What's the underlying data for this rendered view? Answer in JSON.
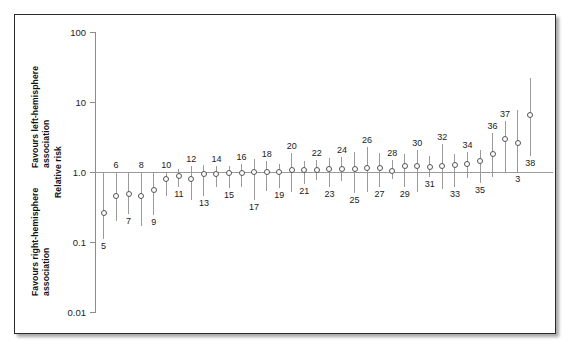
{
  "figure": {
    "kind": "forest-plot",
    "border_color": "#2b2b2b",
    "background": "#ffffff"
  },
  "axis": {
    "y_title": "Relative risk",
    "upper_region_label_line1": "Favours left-hemisphere",
    "upper_region_label_line2": "association",
    "lower_region_label_line1": "Favours right-hemisphere",
    "lower_region_label_line2": "association",
    "tick_labels": [
      "100",
      "10",
      "1.0",
      "0.1",
      "0.01"
    ],
    "tick_values": [
      100,
      10,
      1.0,
      0.1,
      0.01
    ],
    "reference_value": "1.0",
    "scale": "log10",
    "line_color": "#8c8c8c"
  },
  "chart_data": {
    "type": "scatter",
    "title": "",
    "subtitle": "",
    "xlabel": "",
    "ylabel": "Relative risk",
    "ylim": [
      0.01,
      100
    ],
    "yscale": "log",
    "grid": false,
    "legend": null,
    "annotations": [
      "Favours left-hemisphere association",
      "Favours right-hemisphere association"
    ],
    "reference_line": 1.0,
    "marker": "open-circle",
    "error_bar": "95% confidence interval",
    "categories": [
      "5",
      "6",
      "7",
      "8",
      "9",
      "10",
      "11",
      "12",
      "13",
      "14",
      "15",
      "16",
      "17",
      "18",
      "19",
      "20",
      "21",
      "22",
      "23",
      "24",
      "25",
      "26",
      "27",
      "28",
      "29",
      "30",
      "31",
      "32",
      "33",
      "34",
      "35",
      "36",
      "37",
      "3",
      "38"
    ],
    "points": [
      {
        "label": "5",
        "label_side": "below",
        "value": 0.26,
        "low": 0.11,
        "high": 1.0
      },
      {
        "label": "6",
        "label_side": "above",
        "value": 0.45,
        "low": 0.2,
        "high": 1.0
      },
      {
        "label": "7",
        "label_side": "below",
        "value": 0.48,
        "low": 0.25,
        "high": 1.0
      },
      {
        "label": "8",
        "label_side": "above",
        "value": 0.46,
        "low": 0.17,
        "high": 1.0
      },
      {
        "label": "9",
        "label_side": "below",
        "value": 0.55,
        "low": 0.24,
        "high": 1.0
      },
      {
        "label": "10",
        "label_side": "above",
        "value": 0.8,
        "low": 0.45,
        "high": 1.0
      },
      {
        "label": "11",
        "label_side": "below",
        "value": 0.88,
        "low": 0.62,
        "high": 1.12
      },
      {
        "label": "12",
        "label_side": "above",
        "value": 0.8,
        "low": 0.4,
        "high": 1.2
      },
      {
        "label": "13",
        "label_side": "below",
        "value": 0.93,
        "low": 0.46,
        "high": 1.25
      },
      {
        "label": "14",
        "label_side": "above",
        "value": 0.93,
        "low": 0.62,
        "high": 1.22
      },
      {
        "label": "15",
        "label_side": "below",
        "value": 0.96,
        "low": 0.6,
        "high": 1.22
      },
      {
        "label": "16",
        "label_side": "above",
        "value": 0.97,
        "low": 0.62,
        "high": 1.3
      },
      {
        "label": "17",
        "label_side": "below",
        "value": 1.0,
        "low": 0.4,
        "high": 1.55
      },
      {
        "label": "18",
        "label_side": "above",
        "value": 1.0,
        "low": 0.54,
        "high": 1.45
      },
      {
        "label": "19",
        "label_side": "below",
        "value": 1.0,
        "low": 0.6,
        "high": 1.3
      },
      {
        "label": "20",
        "label_side": "above",
        "value": 1.06,
        "low": 0.52,
        "high": 1.85
      },
      {
        "label": "21",
        "label_side": "below",
        "value": 1.06,
        "low": 0.68,
        "high": 1.42
      },
      {
        "label": "22",
        "label_side": "above",
        "value": 1.08,
        "low": 0.78,
        "high": 1.5
      },
      {
        "label": "23",
        "label_side": "below",
        "value": 1.1,
        "low": 0.62,
        "high": 1.6
      },
      {
        "label": "24",
        "label_side": "above",
        "value": 1.12,
        "low": 0.74,
        "high": 1.62
      },
      {
        "label": "25",
        "label_side": "below",
        "value": 1.12,
        "low": 0.5,
        "high": 1.95
      },
      {
        "label": "26",
        "label_side": "above",
        "value": 1.13,
        "low": 0.52,
        "high": 2.3
      },
      {
        "label": "27",
        "label_side": "below",
        "value": 1.15,
        "low": 0.62,
        "high": 1.85
      },
      {
        "label": "28",
        "label_side": "above",
        "value": 1.05,
        "low": 0.8,
        "high": 1.48
      },
      {
        "label": "29",
        "label_side": "below",
        "value": 1.2,
        "low": 0.62,
        "high": 1.8
      },
      {
        "label": "30",
        "label_side": "above",
        "value": 1.2,
        "low": 0.52,
        "high": 2.05
      },
      {
        "label": "31",
        "label_side": "below",
        "value": 1.18,
        "low": 0.84,
        "high": 1.68
      },
      {
        "label": "32",
        "label_side": "above",
        "value": 1.22,
        "low": 0.58,
        "high": 2.5
      },
      {
        "label": "33",
        "label_side": "below",
        "value": 1.25,
        "low": 0.62,
        "high": 1.8
      },
      {
        "label": "34",
        "label_side": "above",
        "value": 1.3,
        "low": 0.82,
        "high": 1.9
      },
      {
        "label": "35",
        "label_side": "below",
        "value": 1.45,
        "low": 0.7,
        "high": 2.05
      },
      {
        "label": "36",
        "label_side": "above",
        "value": 1.8,
        "low": 0.85,
        "high": 3.6
      },
      {
        "label": "37",
        "label_side": "above",
        "value": 3.0,
        "low": 1.0,
        "high": 5.3
      },
      {
        "label": "3",
        "label_side": "below",
        "value": 2.6,
        "low": 1.0,
        "high": 7.8
      },
      {
        "label": "38",
        "label_side": "below",
        "value": 6.6,
        "low": 1.7,
        "high": 22.0
      }
    ]
  }
}
